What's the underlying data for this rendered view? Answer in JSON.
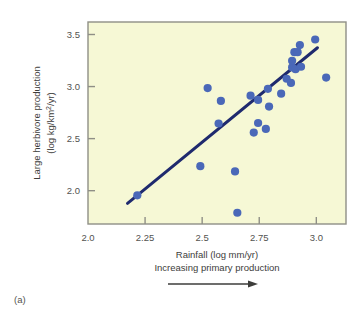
{
  "figure": {
    "panel_label": "(a)",
    "plot_background": "#f6f8d5",
    "frame_color": "#8f8f86",
    "point_color": "#4a68b8",
    "line_color": "#1f2a6e"
  },
  "chart_data": {
    "type": "scatter",
    "title": "",
    "xlabel": "Rainfall (log mm/yr)",
    "xlabel_secondary": "Increasing primary production",
    "ylabel_line1": "Large herbivore production",
    "ylabel_line2": "(log kg/km²/yr)",
    "ylabel": "Large herbivore production (log kg/km2/yr)",
    "xlim": [
      2.0,
      3.13
    ],
    "ylim": [
      1.68,
      3.62
    ],
    "xticks": [
      2.0,
      2.25,
      2.5,
      2.75,
      3.0
    ],
    "xticklabels": [
      "2.0",
      "2.25",
      "2.5",
      "2.75",
      "3.0"
    ],
    "yticks": [
      2.0,
      2.5,
      3.0,
      3.5
    ],
    "yticklabels": [
      "2.0",
      "2.5",
      "3.0",
      "3.5"
    ],
    "grid": false,
    "legend": null,
    "annotations": [
      {
        "name": "increasing-production-arrow",
        "text": "",
        "direction": "right"
      }
    ],
    "points": [
      {
        "x": 2.216,
        "y": 1.955
      },
      {
        "x": 2.492,
        "y": 2.235
      },
      {
        "x": 2.524,
        "y": 2.985
      },
      {
        "x": 2.572,
        "y": 2.645
      },
      {
        "x": 2.582,
        "y": 2.862
      },
      {
        "x": 2.644,
        "y": 2.185
      },
      {
        "x": 2.654,
        "y": 1.788
      },
      {
        "x": 2.712,
        "y": 2.912
      },
      {
        "x": 2.726,
        "y": 2.558
      },
      {
        "x": 2.745,
        "y": 2.872
      },
      {
        "x": 2.745,
        "y": 2.65
      },
      {
        "x": 2.779,
        "y": 2.593
      },
      {
        "x": 2.788,
        "y": 2.978
      },
      {
        "x": 2.793,
        "y": 2.808
      },
      {
        "x": 2.846,
        "y": 2.932
      },
      {
        "x": 2.87,
        "y": 3.075
      },
      {
        "x": 2.889,
        "y": 3.035
      },
      {
        "x": 2.894,
        "y": 3.185
      },
      {
        "x": 2.894,
        "y": 3.248
      },
      {
        "x": 2.904,
        "y": 3.33
      },
      {
        "x": 2.909,
        "y": 3.166
      },
      {
        "x": 2.918,
        "y": 3.33
      },
      {
        "x": 2.928,
        "y": 3.398
      },
      {
        "x": 2.933,
        "y": 3.19
      },
      {
        "x": 2.995,
        "y": 3.452
      },
      {
        "x": 3.043,
        "y": 3.086
      }
    ],
    "trend_line": {
      "name": "regression-line",
      "x_start": 2.173,
      "y_start": 1.878,
      "x_end": 3.005,
      "y_end": 3.373
    }
  }
}
